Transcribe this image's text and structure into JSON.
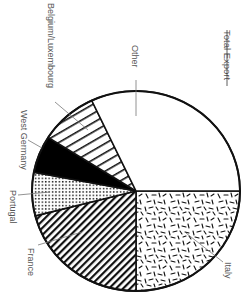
{
  "chart_data": {
    "type": "pie",
    "title": "Total Export",
    "orientation": "rotated 90° clockwise (text reads top-to-bottom)",
    "categories": [
      "Italy",
      "France",
      "Portugal",
      "West Germany",
      "Belgium/Luxembourg",
      "Other"
    ],
    "values": [
      25,
      21,
      7,
      6,
      9,
      32
    ],
    "unit": "% of total export (estimated from slice angles)",
    "slices": [
      {
        "label": "Italy",
        "value": 25,
        "pattern": "random-dashes"
      },
      {
        "label": "France",
        "value": 21,
        "pattern": "diagonal-stripes-dense"
      },
      {
        "label": "Portugal",
        "value": 7,
        "pattern": "dot-grid"
      },
      {
        "label": "West Germany",
        "value": 6,
        "pattern": "solid-black"
      },
      {
        "label": "Belgium/Luxembourg",
        "value": 9,
        "pattern": "diagonal-stripes-wide"
      },
      {
        "label": "Other",
        "value": 32,
        "pattern": "blank"
      }
    ],
    "legend": "none (leader-line labels)",
    "grid": false
  },
  "title": "Total Export",
  "labels": {
    "italy": "Italy",
    "france": "France",
    "portugal": "Portugal",
    "west_germany": "West Germany",
    "belgium": "Belgium/Luxembourg",
    "other": "Other"
  },
  "colors": {
    "stroke": "#111111",
    "fill_black": "#000000",
    "background": "#ffffff",
    "label_text": "#555555",
    "leader_line": "#777777"
  }
}
